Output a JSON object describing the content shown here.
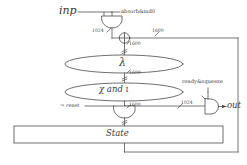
{
  "diagram": {
    "colors": {
      "stroke": "#4a4a4a",
      "text": "#3a3a3a",
      "background": "#ffffff"
    },
    "signals": {
      "input": "inp",
      "output": "out",
      "absorb_enable": "absorb&md0",
      "ready_squeeze": "ready&squeeze",
      "reset": "¬ reset"
    },
    "blocks": {
      "lambda": "λ",
      "chi_iota": "χ and ι",
      "state": "State"
    },
    "widths": {
      "input_bus": "1024",
      "feedback_bus": "1600",
      "xor_out": "1600",
      "lambda_out": "1600",
      "chi_out": "1600",
      "squeeze_bus": "1024"
    },
    "icons": {
      "and_gate_input": "and-gate-icon",
      "and_gate_reset": "and-gate-icon",
      "and_gate_output": "and-gate-icon",
      "xor": "xor-gate-icon"
    }
  }
}
